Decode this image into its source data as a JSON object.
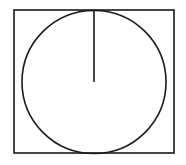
{
  "diagram": {
    "stroke_color": "#1a1a1a",
    "background": "#ffffff",
    "rectangle": {
      "x": 14,
      "y": 10,
      "width": 160,
      "height": 143
    },
    "circle": {
      "cx": 94,
      "cy": 82,
      "rx": 72,
      "ry": 71.5
    },
    "radius_line": {
      "x1": 94,
      "y1": 10,
      "x2": 94,
      "y2": 82
    }
  }
}
